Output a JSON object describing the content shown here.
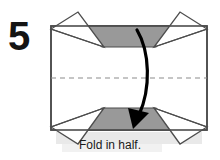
{
  "step": {
    "number": "5"
  },
  "caption": {
    "text": "Fold in half."
  },
  "colors": {
    "paper_shaded": "#999999",
    "paper_white": "#ffffff",
    "outline": "#4d4d4d",
    "fold_line": "#8c8c8c",
    "arrow": "#000000",
    "text": "#141414",
    "shadow": "#e9e9e9",
    "background": "#ffffff"
  },
  "diagram": {
    "type": "origami-step",
    "title_icon": "fold-arrow-icon",
    "model_bounds": {
      "left": 51,
      "top": 26,
      "right": 207,
      "bottom": 130
    },
    "fold_line": {
      "style": "dashed",
      "orientation": "horizontal",
      "y": 78,
      "x_start": 51,
      "x_end": 207
    },
    "shaded_regions": [
      {
        "name": "top-shaded-trapezoid",
        "points": "88,26 170,26 156,47 102,47"
      },
      {
        "name": "bottom-shaded-trapezoid",
        "points": "102,108 156,108 170,130 88,130"
      }
    ],
    "flaps": [
      {
        "name": "top-left-flap",
        "points": "51,29 78,12 104,47"
      },
      {
        "name": "top-right-flap",
        "points": "207,29 180,12 154,47"
      },
      {
        "name": "bottom-left-flap",
        "points": "51,127 78,144 104,108"
      },
      {
        "name": "bottom-right-flap",
        "points": "207,127 180,144 154,108"
      }
    ],
    "arrow": {
      "name": "fold-direction-arrow",
      "path": "M 137,30 C 150,52 151,88 139,115",
      "head": "133,128 129,110 148,113",
      "direction": "downward-curved"
    }
  }
}
